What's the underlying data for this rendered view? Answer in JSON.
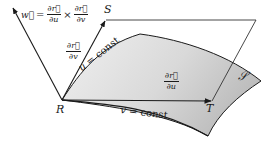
{
  "figure": {
    "points": {
      "R": "R",
      "S": "S",
      "T": "T"
    },
    "surface_label": "𝒮",
    "vector_w": {
      "lhs": "w⃗",
      "equals": "=",
      "times": "×",
      "frac1_num": "∂r⃗",
      "frac1_den": "∂u",
      "frac2_num": "∂r⃗",
      "frac2_den": "∂v"
    },
    "partial_v": {
      "num": "∂r⃗",
      "den": "∂v"
    },
    "partial_u": {
      "num": "∂r⃗",
      "den": "∂u"
    },
    "curve_u": {
      "var": "u",
      "text": " = const"
    },
    "curve_v": {
      "var": "v",
      "text": " = const"
    },
    "colors": {
      "surface_fill": "#d4d4d4",
      "surface_fill_light": "#ececec",
      "stroke": "#1a1a1a",
      "plane_stroke": "#333333"
    }
  }
}
